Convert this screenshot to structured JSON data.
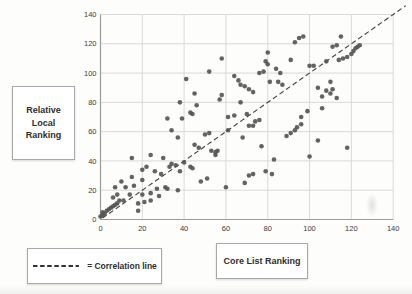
{
  "figure": {
    "ylabel_box": {
      "lines": [
        "Relative",
        "Local",
        "Ranking"
      ]
    },
    "xlabel_box": {
      "label": "Core List Ranking"
    },
    "legend_box": {
      "label": "= Correlation line"
    }
  },
  "chart_data": {
    "type": "scatter",
    "title": "",
    "xlabel": "Core List Ranking",
    "ylabel": "Relative Local Ranking",
    "xlim": [
      0,
      140
    ],
    "ylim": [
      0,
      140
    ],
    "x_ticks": [
      0,
      20,
      40,
      60,
      80,
      100,
      120,
      140
    ],
    "y_ticks": [
      0,
      20,
      40,
      60,
      80,
      100,
      120,
      140
    ],
    "grid": true,
    "legend_entries": [
      "= Correlation line"
    ],
    "legend_position": "bottom-left",
    "correlation_line": {
      "style": "dashed",
      "from": [
        0,
        0
      ],
      "to": [
        146,
        146
      ]
    },
    "colors": {
      "point": "#525252",
      "grid": "#d9d9d9",
      "axis": "#9b9b9b",
      "line": "#3f3f3f",
      "tick_text": "#3a3a3a"
    },
    "points": [
      [
        0,
        2
      ],
      [
        1,
        3
      ],
      [
        1,
        5
      ],
      [
        2,
        4
      ],
      [
        3,
        6
      ],
      [
        4,
        7
      ],
      [
        5,
        8
      ],
      [
        6,
        9
      ],
      [
        7,
        10
      ],
      [
        8,
        11
      ],
      [
        9,
        13
      ],
      [
        11,
        13
      ],
      [
        6,
        15
      ],
      [
        8,
        17
      ],
      [
        7,
        22
      ],
      [
        10,
        26
      ],
      [
        12,
        22
      ],
      [
        14,
        17
      ],
      [
        16,
        23
      ],
      [
        15,
        29
      ],
      [
        20,
        17
      ],
      [
        20,
        27
      ],
      [
        24,
        18
      ],
      [
        27,
        21
      ],
      [
        28,
        16
      ],
      [
        31,
        22
      ],
      [
        18,
        6
      ],
      [
        18,
        11
      ],
      [
        21,
        12
      ],
      [
        24,
        13
      ],
      [
        20,
        34
      ],
      [
        22,
        36
      ],
      [
        26,
        33
      ],
      [
        29,
        31
      ],
      [
        15,
        42
      ],
      [
        24,
        44
      ],
      [
        30,
        42
      ],
      [
        33,
        36
      ],
      [
        34,
        38
      ],
      [
        36,
        37
      ],
      [
        38,
        33
      ],
      [
        40,
        39
      ],
      [
        43,
        36
      ],
      [
        44,
        35
      ],
      [
        32,
        21
      ],
      [
        37,
        20
      ],
      [
        48,
        26
      ],
      [
        51,
        28
      ],
      [
        60,
        22
      ],
      [
        69,
        25
      ],
      [
        71,
        30
      ],
      [
        73,
        31
      ],
      [
        79,
        33
      ],
      [
        82,
        31
      ],
      [
        83,
        41
      ],
      [
        32,
        69
      ],
      [
        34,
        61
      ],
      [
        37,
        56
      ],
      [
        39,
        69
      ],
      [
        45,
        51
      ],
      [
        47,
        49
      ],
      [
        50,
        58
      ],
      [
        52,
        59
      ],
      [
        53,
        47
      ],
      [
        55,
        44
      ],
      [
        55,
        46
      ],
      [
        56,
        47
      ],
      [
        61,
        61
      ],
      [
        68,
        56
      ],
      [
        77,
        50
      ],
      [
        71,
        64
      ],
      [
        73,
        64
      ],
      [
        74,
        67
      ],
      [
        76,
        68
      ],
      [
        61,
        70
      ],
      [
        64,
        71
      ],
      [
        70,
        72
      ],
      [
        57,
        82
      ],
      [
        58,
        85
      ],
      [
        67,
        80
      ],
      [
        38,
        80
      ],
      [
        41,
        96
      ],
      [
        43,
        73
      ],
      [
        44,
        72
      ],
      [
        45,
        86
      ],
      [
        46,
        78
      ],
      [
        52,
        101
      ],
      [
        58,
        110
      ],
      [
        64,
        98
      ],
      [
        66,
        95
      ],
      [
        67,
        92
      ],
      [
        69,
        91
      ],
      [
        71,
        89
      ],
      [
        73,
        87
      ],
      [
        76,
        100
      ],
      [
        78,
        101
      ],
      [
        79,
        108
      ],
      [
        80,
        106
      ],
      [
        80,
        114
      ],
      [
        81,
        94
      ],
      [
        84,
        103
      ],
      [
        85,
        94
      ],
      [
        86,
        100
      ],
      [
        87,
        92
      ],
      [
        91,
        109
      ],
      [
        93,
        121
      ],
      [
        95,
        124
      ],
      [
        97,
        125
      ],
      [
        89,
        57
      ],
      [
        91,
        59
      ],
      [
        93,
        61
      ],
      [
        94,
        63
      ],
      [
        96,
        65
      ],
      [
        96,
        70
      ],
      [
        99,
        74
      ],
      [
        106,
        76
      ],
      [
        100,
        43
      ],
      [
        104,
        54
      ],
      [
        118,
        49
      ],
      [
        104,
        90
      ],
      [
        106,
        84
      ],
      [
        108,
        88
      ],
      [
        110,
        86
      ],
      [
        110,
        94
      ],
      [
        111,
        89
      ],
      [
        113,
        83
      ],
      [
        100,
        105
      ],
      [
        102,
        105
      ],
      [
        108,
        108
      ],
      [
        114,
        109
      ],
      [
        116,
        110
      ],
      [
        118,
        111
      ],
      [
        111,
        118
      ],
      [
        113,
        119
      ],
      [
        115,
        125
      ],
      [
        120,
        113
      ],
      [
        121,
        115
      ],
      [
        122,
        117
      ],
      [
        123,
        118
      ],
      [
        124,
        119
      ]
    ]
  }
}
